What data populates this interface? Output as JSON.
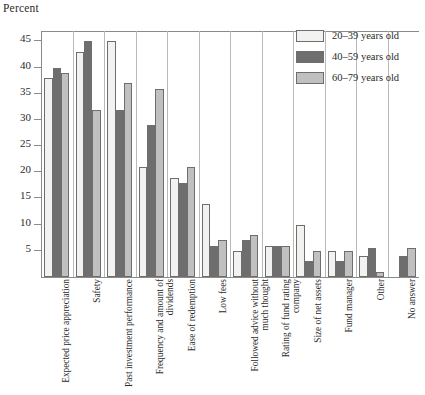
{
  "chart_data": {
    "type": "bar",
    "title": "",
    "subtitle": "",
    "ylabel": "Percent",
    "xlabel": "",
    "ylim": [
      0,
      47
    ],
    "yticks": [
      5,
      10,
      15,
      20,
      25,
      30,
      35,
      40,
      45
    ],
    "grid": false,
    "legend_position": "top-right",
    "categories": [
      "Expected price appreciation",
      "Safety",
      "Past investment performance",
      "Frequency and amount of dividends",
      "Ease of redemption",
      "Low fees",
      "Followed advice without much thought",
      "Rating of fund rating company",
      "Size of net assets",
      "Fund manager",
      "Other",
      "No answer"
    ],
    "series": [
      {
        "name": "20–39 years old",
        "color": "#f2f2f0",
        "values": [
          38,
          43,
          45,
          21,
          19,
          14,
          5,
          6,
          10,
          5,
          4,
          0
        ]
      },
      {
        "name": "40–59 years old",
        "color": "#6e6e6e",
        "values": [
          40,
          45,
          32,
          29,
          18,
          6,
          7,
          6,
          3,
          3,
          5.5,
          4
        ]
      },
      {
        "name": "60–79 years old",
        "color": "#c0c0c0",
        "values": [
          39,
          32,
          37,
          36,
          21,
          7,
          8,
          6,
          5,
          5,
          1,
          5.5
        ]
      }
    ]
  },
  "legend": {
    "items": [
      {
        "label": "20–39 years old",
        "color": "#f2f2f0"
      },
      {
        "label": "40–59 years old",
        "color": "#6e6e6e"
      },
      {
        "label": "60–79 years old",
        "color": "#c0c0c0"
      }
    ]
  },
  "axis": {
    "y_title": "Percent"
  }
}
